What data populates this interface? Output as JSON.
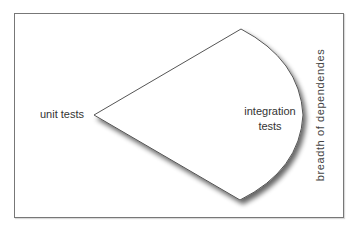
{
  "diagram": {
    "labels": {
      "unit_tests": "unit tests",
      "integration_line1": "integration",
      "integration_line2": "tests",
      "axis": "breadth of dependendes"
    },
    "colors": {
      "stroke": "#555555",
      "frame": "#777777",
      "fill": "#ffffff"
    }
  }
}
